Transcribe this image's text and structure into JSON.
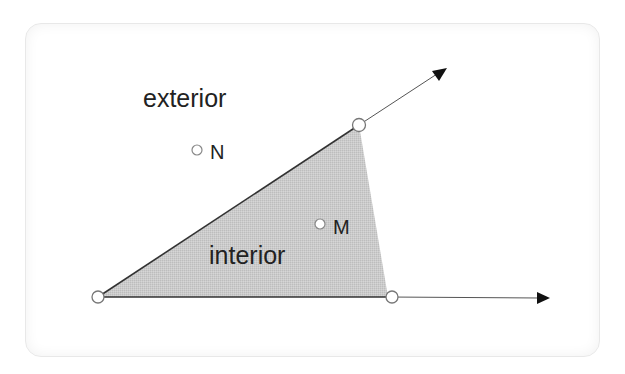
{
  "diagram": {
    "title": "",
    "colors": {
      "card_border": "#e8e8e8",
      "region_fill": "#c9c9c9",
      "edge_stroke": "#333333",
      "ray_stroke": "#555555",
      "arrowhead": "#111111",
      "point_fill": "#ffffff",
      "point_stroke": "#777777",
      "text": "#222222"
    },
    "vertex": {
      "x": 98,
      "y": 297
    },
    "rays": [
      {
        "name": "upper-ray",
        "from": [
          98,
          297
        ],
        "to": [
          447,
          68
        ]
      },
      {
        "name": "lower-ray",
        "from": [
          98,
          297
        ],
        "to": [
          549,
          298
        ]
      }
    ],
    "shaded_region": {
      "points": [
        [
          98,
          297
        ],
        [
          359,
          125
        ],
        [
          388,
          297
        ]
      ]
    },
    "ray_points": [
      {
        "name": "upper-ray-point",
        "x": 359,
        "y": 125
      },
      {
        "name": "lower-ray-point",
        "x": 392,
        "y": 297
      },
      {
        "name": "vertex-point",
        "x": 98,
        "y": 297
      }
    ],
    "region_labels": {
      "exterior": "exterior",
      "interior": "interior"
    },
    "labeled_points": [
      {
        "label": "N",
        "x": 196,
        "y": 150
      },
      {
        "label": "M",
        "x": 320,
        "y": 224
      }
    ]
  }
}
